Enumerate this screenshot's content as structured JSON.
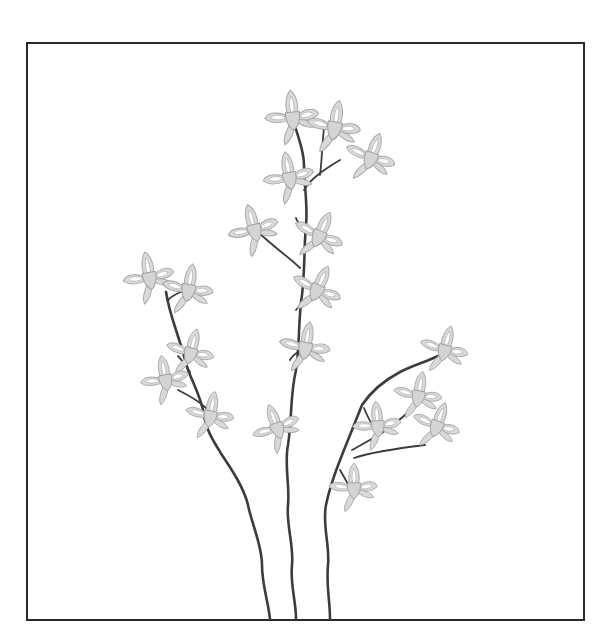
{
  "illustration": {
    "subject": "line-art flowering plant with three stems in a rectangular frame",
    "colors": {
      "background": "#ffffff",
      "frame": "#2a2a2a",
      "stem": "#3c3c3c",
      "petal_fill": "#d9d9d9",
      "petal_stroke": "#a8a8a8"
    },
    "frame": {
      "x": 27,
      "y": 43,
      "width": 557,
      "height": 577
    },
    "stems": [
      {
        "name": "left-stem",
        "d": "M270 619 C268 600 262 585 262 565 C262 545 252 525 248 505 C244 488 232 470 222 455 C214 442 206 430 204 415 C202 400 194 385 188 370 C184 355 180 342 176 330 C172 318 168 305 166 292"
      },
      {
        "name": "middle-stem",
        "d": "M296 619 C296 600 290 585 292 565 C294 545 286 525 288 505 C290 485 284 465 288 445 C292 420 290 395 296 370 C300 345 298 320 302 295 C305 270 304 245 306 225 C308 205 304 185 304 165 C304 150 298 138 294 122"
      },
      {
        "name": "right-stem",
        "d": "M330 619 C330 600 326 585 328 565 C330 545 322 525 326 505 C330 485 336 470 342 455 C350 435 356 420 362 405 C372 390 385 380 400 372 C412 366 425 362 438 356"
      }
    ],
    "twigs": [
      {
        "d": "M168 300 C172 296 180 292 186 290"
      },
      {
        "d": "M190 372 C186 365 182 360 178 356"
      },
      {
        "d": "M206 408 C200 402 190 396 178 390"
      },
      {
        "d": "M304 190 C310 180 320 172 340 160"
      },
      {
        "d": "M320 175 C322 160 322 145 324 128"
      },
      {
        "d": "M306 232 C300 225 296 220 296 218"
      },
      {
        "d": "M300 268 C290 258 275 248 258 232"
      },
      {
        "d": "M296 310 C300 305 305 300 310 298"
      },
      {
        "d": "M290 360 C292 356 295 354 298 352"
      },
      {
        "d": "M352 450 C370 440 390 430 408 412"
      },
      {
        "d": "M354 458 C372 452 400 448 425 445"
      },
      {
        "d": "M364 408 C368 418 372 425 376 430"
      },
      {
        "d": "M340 470 C346 480 350 488 352 492"
      }
    ],
    "flowers": [
      {
        "x": 293,
        "y": 120,
        "s": 1.0,
        "r": -5
      },
      {
        "x": 334,
        "y": 130,
        "s": 1.0,
        "r": 10
      },
      {
        "x": 370,
        "y": 160,
        "s": 0.95,
        "r": 20
      },
      {
        "x": 290,
        "y": 180,
        "s": 0.95,
        "r": -10
      },
      {
        "x": 255,
        "y": 232,
        "s": 0.95,
        "r": -15
      },
      {
        "x": 318,
        "y": 238,
        "s": 0.95,
        "r": 25
      },
      {
        "x": 316,
        "y": 292,
        "s": 0.95,
        "r": 25
      },
      {
        "x": 305,
        "y": 350,
        "s": 0.95,
        "r": 10
      },
      {
        "x": 150,
        "y": 280,
        "s": 0.95,
        "r": -10
      },
      {
        "x": 188,
        "y": 292,
        "s": 0.95,
        "r": 10
      },
      {
        "x": 190,
        "y": 355,
        "s": 0.9,
        "r": 15
      },
      {
        "x": 166,
        "y": 382,
        "s": 0.9,
        "r": -10
      },
      {
        "x": 210,
        "y": 418,
        "s": 0.9,
        "r": 10
      },
      {
        "x": 278,
        "y": 430,
        "s": 0.9,
        "r": -20
      },
      {
        "x": 444,
        "y": 352,
        "s": 0.9,
        "r": 15
      },
      {
        "x": 418,
        "y": 398,
        "s": 0.9,
        "r": 10
      },
      {
        "x": 378,
        "y": 428,
        "s": 0.9,
        "r": -5
      },
      {
        "x": 436,
        "y": 428,
        "s": 0.9,
        "r": 20
      },
      {
        "x": 354,
        "y": 490,
        "s": 0.9,
        "r": 0
      }
    ]
  }
}
